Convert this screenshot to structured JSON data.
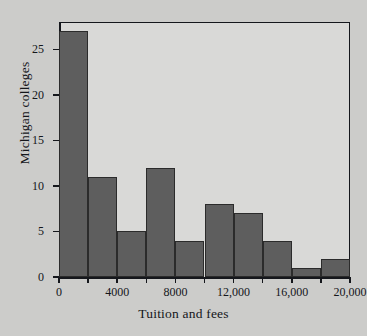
{
  "chart_data": {
    "type": "bar",
    "title": "",
    "xlabel": "Tuition and fees",
    "ylabel": "Michigan colleges",
    "bin_width": 2000,
    "xlim": [
      0,
      20000
    ],
    "ylim": [
      0,
      28
    ],
    "grid": false,
    "legend": null,
    "categories": [
      "0-2000",
      "2000-4000",
      "4000-6000",
      "6000-8000",
      "8000-10,000",
      "10,000-12,000",
      "12,000-14,000",
      "14,000-16,000",
      "16,000-18,000",
      "18,000-20,000"
    ],
    "bin_edges": [
      0,
      2000,
      4000,
      6000,
      8000,
      10000,
      12000,
      14000,
      16000,
      18000,
      20000
    ],
    "values": [
      27,
      11,
      5,
      12,
      4,
      8,
      7,
      4,
      1,
      2
    ],
    "x_ticks": [
      {
        "value": 0,
        "label": "0",
        "major": true
      },
      {
        "value": 2000,
        "label": "",
        "major": false
      },
      {
        "value": 4000,
        "label": "4000",
        "major": true
      },
      {
        "value": 6000,
        "label": "",
        "major": false
      },
      {
        "value": 8000,
        "label": "8000",
        "major": true
      },
      {
        "value": 10000,
        "label": "",
        "major": false
      },
      {
        "value": 12000,
        "label": "12,000",
        "major": true
      },
      {
        "value": 14000,
        "label": "",
        "major": false
      },
      {
        "value": 16000,
        "label": "16,000",
        "major": true
      },
      {
        "value": 18000,
        "label": "",
        "major": false
      },
      {
        "value": 20000,
        "label": "20,000",
        "major": true
      }
    ],
    "y_ticks": [
      {
        "value": 0,
        "label": "0"
      },
      {
        "value": 5,
        "label": "5"
      },
      {
        "value": 10,
        "label": "10"
      },
      {
        "value": 15,
        "label": "15"
      },
      {
        "value": 20,
        "label": "20"
      },
      {
        "value": 25,
        "label": "25"
      }
    ],
    "colors": {
      "bar_fill": "#5e5e5e",
      "bar_edge": "#2b2b2b",
      "plot_background": "#d9d9d7",
      "figure_background": "#ccccca",
      "axis": "#15171c",
      "text": "#14161a"
    }
  }
}
